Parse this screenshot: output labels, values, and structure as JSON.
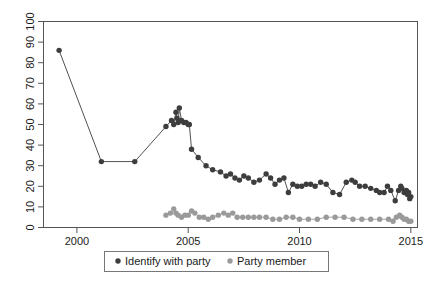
{
  "chart_data": {
    "type": "line",
    "title": "",
    "subtitle": "",
    "xlabel": "",
    "ylabel": "",
    "xlim": [
      1998.5,
      2015.3
    ],
    "ylim": [
      0,
      100
    ],
    "xticks": [
      2000,
      2005,
      2010,
      2015
    ],
    "xtick_labels": [
      "2000",
      "2005",
      "2010",
      "2015"
    ],
    "yticks": [
      0,
      10,
      20,
      30,
      40,
      50,
      60,
      70,
      80,
      90,
      100
    ],
    "ytick_labels": [
      "0",
      "10",
      "20",
      "30",
      "40",
      "50",
      "60",
      "70",
      "80",
      "90",
      "100"
    ],
    "grid": false,
    "legend_position": "bottom-center",
    "series": [
      {
        "name": "Identify with party",
        "color": "#3d3d3d",
        "marker": "circle",
        "points": [
          [
            1999.2,
            86
          ],
          [
            2001.1,
            32
          ],
          [
            2002.6,
            32
          ],
          [
            2004.0,
            49
          ],
          [
            2004.25,
            52
          ],
          [
            2004.35,
            50
          ],
          [
            2004.45,
            56
          ],
          [
            2004.5,
            53
          ],
          [
            2004.55,
            51
          ],
          [
            2004.6,
            58
          ],
          [
            2004.7,
            52
          ],
          [
            2004.8,
            51
          ],
          [
            2004.9,
            51
          ],
          [
            2005.0,
            50
          ],
          [
            2005.05,
            50
          ],
          [
            2005.15,
            38
          ],
          [
            2005.45,
            34
          ],
          [
            2005.8,
            30
          ],
          [
            2006.1,
            28
          ],
          [
            2006.45,
            27
          ],
          [
            2006.7,
            25
          ],
          [
            2006.9,
            26
          ],
          [
            2007.1,
            24
          ],
          [
            2007.3,
            23
          ],
          [
            2007.5,
            25
          ],
          [
            2007.7,
            24
          ],
          [
            2007.95,
            22
          ],
          [
            2008.2,
            23
          ],
          [
            2008.5,
            26
          ],
          [
            2008.7,
            24
          ],
          [
            2008.9,
            21
          ],
          [
            2009.1,
            23
          ],
          [
            2009.3,
            24
          ],
          [
            2009.5,
            17
          ],
          [
            2009.7,
            21
          ],
          [
            2009.9,
            20
          ],
          [
            2010.1,
            20
          ],
          [
            2010.3,
            21
          ],
          [
            2010.5,
            21
          ],
          [
            2010.7,
            20
          ],
          [
            2010.95,
            22
          ],
          [
            2011.2,
            21
          ],
          [
            2011.5,
            17
          ],
          [
            2011.8,
            16
          ],
          [
            2012.1,
            22
          ],
          [
            2012.35,
            23
          ],
          [
            2012.5,
            22
          ],
          [
            2012.7,
            20
          ],
          [
            2012.95,
            20
          ],
          [
            2013.2,
            19
          ],
          [
            2013.45,
            18
          ],
          [
            2013.6,
            17
          ],
          [
            2013.8,
            17
          ],
          [
            2013.95,
            20
          ],
          [
            2014.1,
            18
          ],
          [
            2014.3,
            13
          ],
          [
            2014.45,
            18
          ],
          [
            2014.55,
            20
          ],
          [
            2014.6,
            19
          ],
          [
            2014.7,
            17
          ],
          [
            2014.8,
            18
          ],
          [
            2014.85,
            16
          ],
          [
            2014.9,
            17
          ],
          [
            2014.95,
            14
          ],
          [
            2015.0,
            15
          ]
        ]
      },
      {
        "name": "Party member",
        "color": "#9a9a9a",
        "marker": "circle",
        "points": [
          [
            2004.0,
            6
          ],
          [
            2004.2,
            7
          ],
          [
            2004.35,
            9
          ],
          [
            2004.45,
            7
          ],
          [
            2004.55,
            6
          ],
          [
            2004.7,
            5
          ],
          [
            2004.85,
            6
          ],
          [
            2005.0,
            6
          ],
          [
            2005.15,
            8
          ],
          [
            2005.3,
            7
          ],
          [
            2005.5,
            5
          ],
          [
            2005.7,
            5
          ],
          [
            2005.9,
            4
          ],
          [
            2006.1,
            5
          ],
          [
            2006.35,
            6
          ],
          [
            2006.6,
            7
          ],
          [
            2006.8,
            6
          ],
          [
            2007.0,
            7
          ],
          [
            2007.2,
            5
          ],
          [
            2007.45,
            5
          ],
          [
            2007.7,
            5
          ],
          [
            2007.95,
            5
          ],
          [
            2008.2,
            5
          ],
          [
            2008.5,
            5
          ],
          [
            2008.8,
            4
          ],
          [
            2009.1,
            4
          ],
          [
            2009.4,
            5
          ],
          [
            2009.7,
            5
          ],
          [
            2010.0,
            4
          ],
          [
            2010.4,
            4
          ],
          [
            2010.8,
            4
          ],
          [
            2011.2,
            5
          ],
          [
            2011.6,
            5
          ],
          [
            2012.0,
            5
          ],
          [
            2012.4,
            4
          ],
          [
            2012.8,
            4
          ],
          [
            2013.2,
            4
          ],
          [
            2013.6,
            4
          ],
          [
            2014.0,
            4
          ],
          [
            2014.2,
            3
          ],
          [
            2014.35,
            5
          ],
          [
            2014.5,
            6
          ],
          [
            2014.6,
            5
          ],
          [
            2014.7,
            4
          ],
          [
            2014.8,
            4
          ],
          [
            2014.9,
            3
          ],
          [
            2015.0,
            3
          ]
        ]
      }
    ]
  },
  "legend": {
    "items": [
      {
        "label": "Identify with party",
        "marker_color": "#3d3d3d"
      },
      {
        "label": "Party member",
        "marker_color": "#9a9a9a"
      }
    ]
  }
}
